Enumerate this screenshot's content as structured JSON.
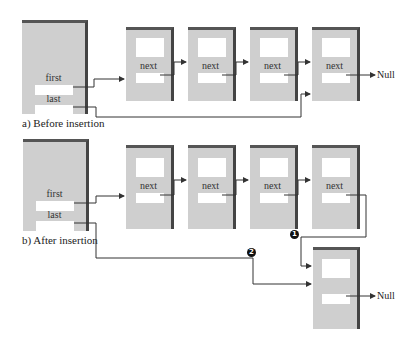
{
  "diagram": {
    "panel_a": {
      "caption": "a) Before insertion",
      "head": {
        "first_label": "first",
        "last_label": "last"
      },
      "nodes": [
        {
          "next_label": "next"
        },
        {
          "next_label": "next"
        },
        {
          "next_label": "next"
        },
        {
          "next_label": "next"
        }
      ],
      "terminal": "Null"
    },
    "panel_b": {
      "caption": "b) After insertion",
      "head": {
        "first_label": "first",
        "last_label": "last"
      },
      "nodes": [
        {
          "next_label": "next"
        },
        {
          "next_label": "next"
        },
        {
          "next_label": "next"
        },
        {
          "next_label": "next"
        }
      ],
      "new_node": {
        "next_label": ""
      },
      "terminal": "Null",
      "markers": [
        "1",
        "2"
      ]
    },
    "colors": {
      "node_fill": "#cfcfcf",
      "node_shadow": "#444444",
      "field": "#ffffff",
      "line": "#333333"
    }
  }
}
